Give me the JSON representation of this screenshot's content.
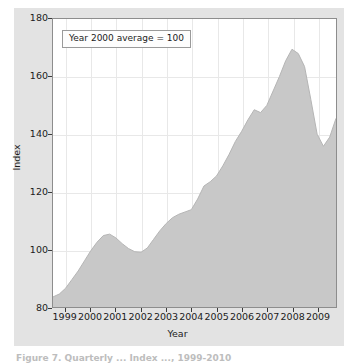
{
  "figure": {
    "background_color": "#ffffff",
    "plate_color": "#e3e3e3",
    "caption_cutoff": "Figure 7. Quarterly ... Index ..., 1999-2010"
  },
  "annotation": {
    "text": "Year 2000 average = 100"
  },
  "axis": {
    "xlabel": "Year",
    "ylabel": "Index"
  },
  "chart_data": {
    "type": "area",
    "title": "",
    "subtitle": "",
    "xlabel": "Year",
    "ylabel": "Index",
    "xlim": [
      1998.5,
      2009.75
    ],
    "ylim": [
      80,
      180
    ],
    "grid": true,
    "legend": null,
    "fill_color": "#c8c8c8",
    "line_color": "#b4b4b4",
    "annotations": [
      "Year 2000 average = 100"
    ],
    "xticks": [
      1999,
      2000,
      2001,
      2002,
      2003,
      2004,
      2005,
      2006,
      2007,
      2008,
      2009
    ],
    "xtick_labels": [
      "1999",
      "2000",
      "2001",
      "2002",
      "2003",
      "2004",
      "2005",
      "2006",
      "2007",
      "2008",
      "2009"
    ],
    "yticks": [
      80,
      100,
      120,
      140,
      160,
      180
    ],
    "ytick_labels": [
      "80",
      "100",
      "120",
      "140",
      "160",
      "180"
    ],
    "x": [
      1998.5,
      1998.75,
      1999.0,
      1999.25,
      1999.5,
      1999.75,
      2000.0,
      2000.25,
      2000.5,
      2000.75,
      2001.0,
      2001.25,
      2001.5,
      2001.75,
      2002.0,
      2002.25,
      2002.5,
      2002.75,
      2003.0,
      2003.25,
      2003.5,
      2003.75,
      2004.0,
      2004.25,
      2004.5,
      2004.75,
      2005.0,
      2005.25,
      2005.5,
      2005.75,
      2006.0,
      2006.25,
      2006.5,
      2006.75,
      2007.0,
      2007.25,
      2007.5,
      2007.75,
      2008.0,
      2008.25,
      2008.5,
      2008.75,
      2009.0,
      2009.25,
      2009.5,
      2009.75
    ],
    "values": [
      83.5,
      84.5,
      86.5,
      89.5,
      92.5,
      96.0,
      99.5,
      102.5,
      104.8,
      105.3,
      104.0,
      102.0,
      100.3,
      99.2,
      99.0,
      100.5,
      103.5,
      106.5,
      109.0,
      111.0,
      112.2,
      113.0,
      113.8,
      117.5,
      122.0,
      123.5,
      125.5,
      129.0,
      133.0,
      137.5,
      141.0,
      145.0,
      148.5,
      147.5,
      150.0,
      155.0,
      160.0,
      165.5,
      169.5,
      168.0,
      163.5,
      152.0,
      140.0,
      135.8,
      139.0,
      145.5
    ],
    "series_name": "Index"
  }
}
